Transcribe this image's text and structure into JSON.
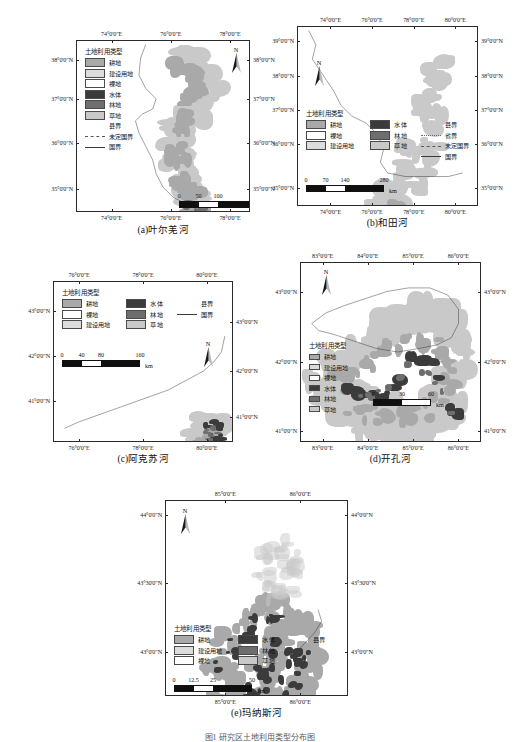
{
  "figure": {
    "caption": "图1  研究区土地利用类型分布图",
    "legend_title": "土地利用类型",
    "scale_unit": "km",
    "north_label": "N",
    "classes": {
      "cropland": {
        "label": "耕地",
        "color": "#a9a9a9"
      },
      "built": {
        "label": "建设用地",
        "color": "#dcdcdc"
      },
      "bare": {
        "label": "裸地",
        "color": "#ffffff"
      },
      "water": {
        "label": "水体",
        "color": "#3b3b3b"
      },
      "forest": {
        "label": "林地",
        "color": "#6e6e6e"
      },
      "grass": {
        "label": "草地",
        "color": "#c9c9c9"
      }
    },
    "boundaries": {
      "county": {
        "label": "县界",
        "style": "none"
      },
      "province": {
        "label": "省界",
        "style": "dot"
      },
      "undefined": {
        "label": "未定国界",
        "style": "dash"
      },
      "national": {
        "label": "国界",
        "style": "solid"
      }
    }
  },
  "panels": [
    {
      "id": "a",
      "caption": "(a)叶尔羌河",
      "legend_layout": "vertical",
      "legend_items": [
        "cropland",
        "built",
        "bare",
        "water",
        "forest",
        "grass"
      ],
      "legend_boundaries": [
        "county",
        "undefined",
        "national"
      ],
      "axis": {
        "x_labels": [
          "74°0'0\"E",
          "76°0'0\"E",
          "78°0'0\"E"
        ],
        "x_pos": [
          0.205,
          0.545,
          0.885
        ],
        "y_labels": [
          "38°0'0\"N",
          "37°0'0\"N",
          "36°0'0\"N",
          "35°0'0\"N"
        ],
        "y_pos": [
          0.115,
          0.345,
          0.6,
          0.865
        ]
      },
      "scale": {
        "ticks": [
          "0",
          "50",
          "100",
          "200"
        ],
        "tick_pos": [
          0,
          0.25,
          0.5,
          1.0
        ]
      }
    },
    {
      "id": "b",
      "caption": "(b)和田河",
      "legend_layout": "three-column",
      "legend_col1": [
        "cropland",
        "bare",
        "built"
      ],
      "legend_col2": [
        "water",
        "forest",
        "grass"
      ],
      "legend_boundaries": [
        "county",
        "province",
        "undefined",
        "national"
      ],
      "axis": {
        "x_labels": [
          "74°0'0\"E",
          "76°0'0\"E",
          "78°0'0\"E",
          "80°0'0\"E"
        ],
        "x_pos": [
          0.185,
          0.415,
          0.645,
          0.875
        ],
        "y_labels": [
          "39°0'0\"N",
          "38°0'0\"N",
          "37°0'0\"N",
          "36°0'0\"N",
          "35°0'0\"N"
        ],
        "y_pos": [
          0.085,
          0.275,
          0.465,
          0.655,
          0.9
        ],
        "y_labels_right": [
          "39°0'0\"N",
          "38°0'0\"N",
          "37°0'0\"N",
          "36°0'0\"N",
          "35°0'0\"N"
        ],
        "y_pos_right": [
          0.085,
          0.275,
          0.465,
          0.655,
          0.9
        ]
      },
      "scale": {
        "ticks": [
          "0",
          "70",
          "140",
          "280"
        ],
        "tick_pos": [
          0,
          0.25,
          0.5,
          1.0
        ]
      }
    },
    {
      "id": "c",
      "caption": "(c)阿克苏河",
      "legend_layout": "three-column",
      "legend_col1": [
        "cropland",
        "bare",
        "built"
      ],
      "legend_col2": [
        "water",
        "forest",
        "grass"
      ],
      "legend_boundaries": [
        "county",
        "national"
      ],
      "axis": {
        "x_labels": [
          "76°0'0\"E",
          "78°0'0\"E",
          "80°0'0\"E"
        ],
        "x_pos": [
          0.145,
          0.5,
          0.855
        ],
        "y_labels": [
          "43°0'0\"N",
          "42°0'0\"N",
          "41°0'0\"N"
        ],
        "y_pos": [
          0.185,
          0.465,
          0.745
        ],
        "y_labels_right": [
          "43°0'0\"N",
          "42°0'0\"N",
          "41°0'0\"N"
        ],
        "y_pos_right": [
          0.255,
          0.56,
          0.845
        ]
      },
      "scale": {
        "ticks": [
          "0",
          "40",
          "80",
          "160"
        ],
        "tick_pos": [
          0,
          0.25,
          0.5,
          1.0
        ]
      }
    },
    {
      "id": "d",
      "caption": "(d)开孔河",
      "legend_layout": "vertical-compact",
      "legend_items": [
        "cropland",
        "built",
        "bare",
        "water",
        "forest",
        "grass"
      ],
      "legend_boundaries": [],
      "axis": {
        "x_labels": [
          "83°0'0\"E",
          "84°0'0\"E",
          "85°0'0\"E",
          "86°0'0\"E"
        ],
        "x_pos": [
          0.125,
          0.375,
          0.625,
          0.875
        ],
        "y_labels": [
          "43°0'0\"N",
          "42°0'0\"N",
          "41°0'0\"N"
        ],
        "y_pos": [
          0.165,
          0.555,
          0.94
        ],
        "y_labels_right": [
          "43°0'0\"N",
          "42°0'0\"N",
          "41°0'0\"N"
        ],
        "y_pos_right": [
          0.165,
          0.555,
          0.94
        ]
      },
      "scale": {
        "ticks": [
          "0",
          "30",
          "60"
        ],
        "tick_pos": [
          0,
          0.5,
          1.0
        ]
      }
    },
    {
      "id": "e",
      "caption": "(e)玛纳斯河",
      "legend_layout": "three-column",
      "legend_col1": [
        "cropland",
        "built",
        "bare"
      ],
      "legend_col2": [
        "water",
        "forest",
        "grass"
      ],
      "legend_boundaries": [
        "county"
      ],
      "axis": {
        "x_labels": [
          "85°0'0\"E",
          "86°0'0\"E"
        ],
        "x_pos": [
          0.33,
          0.74
        ],
        "y_labels": [
          "44°0'0\"N",
          "43°30'0\"N",
          "43°0'0\"N"
        ],
        "y_pos": [
          0.075,
          0.425,
          0.775
        ],
        "y_labels_right": [
          "44°0'0\"N",
          "43°30'0\"N",
          "43°0'0\"N"
        ],
        "y_pos_right": [
          0.075,
          0.425,
          0.775
        ]
      },
      "scale": {
        "ticks": [
          "0",
          "12.5",
          "25",
          "50"
        ],
        "tick_pos": [
          0,
          0.25,
          0.5,
          1.0
        ]
      }
    }
  ]
}
